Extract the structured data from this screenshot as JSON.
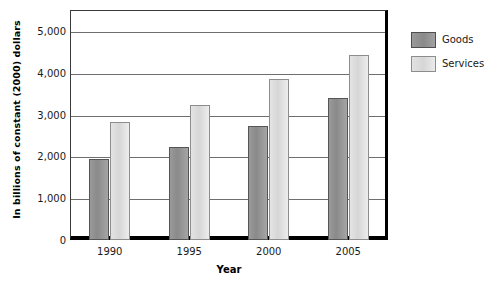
{
  "chart_data": {
    "type": "bar",
    "title": "",
    "subtitle": "",
    "xlabel": "Year",
    "ylabel": "In billions of constant (2000) dollars",
    "categories": [
      "1990",
      "1995",
      "2000",
      "2005"
    ],
    "series": [
      {
        "name": "Goods",
        "color": "#8f8f8f",
        "values": [
          1930,
          2220,
          2730,
          3400
        ]
      },
      {
        "name": "Services",
        "color": "#dcdcdc",
        "values": [
          2830,
          3230,
          3850,
          4420
        ]
      }
    ],
    "ylim": [
      0,
      5500
    ],
    "yticks": [
      0,
      1000,
      2000,
      3000,
      4000,
      5000
    ],
    "ytick_labels": [
      "0",
      "1,000",
      "2,000",
      "3,000",
      "4,000",
      "5,000"
    ],
    "grid": true,
    "grid_axis": "y",
    "legend_position": "right-top",
    "legend_entries": [
      "Goods",
      "Services"
    ]
  }
}
